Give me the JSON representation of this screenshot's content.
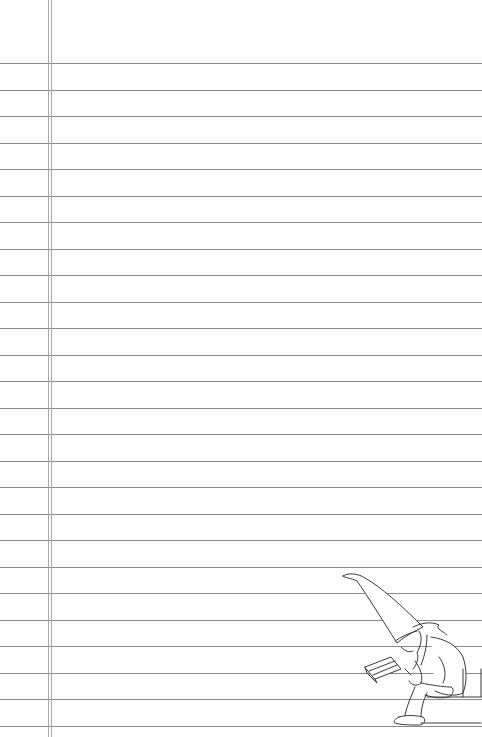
{
  "paper": {
    "type": "lined-notebook-page",
    "background_color": "#fdfdfd",
    "rule_color": "#8a8a8a",
    "margin_color": "#a9a9a9",
    "rule_count": 26,
    "first_rule_y": 63,
    "rule_spacing": 26.52,
    "margin_lines_x": [
      48,
      51
    ]
  },
  "illustration": {
    "subject": "gnome-reading-book-on-step",
    "position": "bottom-right",
    "stroke_color": "#3a3a3a"
  }
}
